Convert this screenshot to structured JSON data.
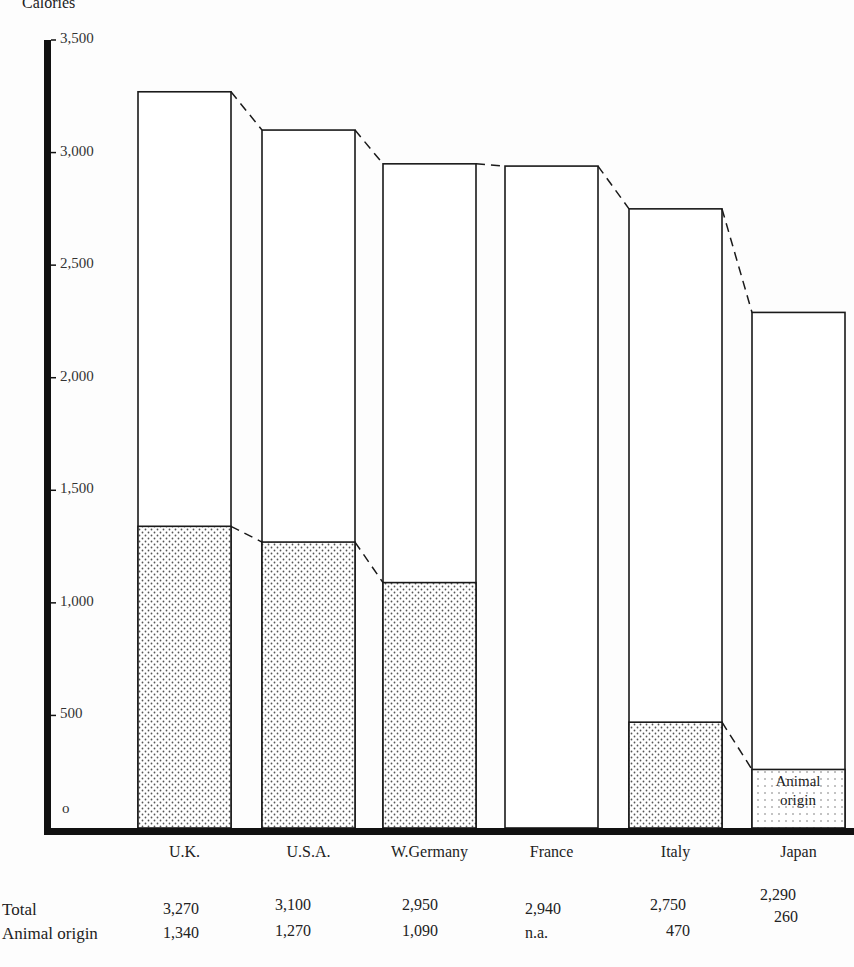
{
  "chart_data": {
    "type": "bar",
    "subtype": "stacked-overlap",
    "title": "",
    "ylabel": "Calories",
    "xlabel": "",
    "ylim": [
      0,
      3500
    ],
    "yticks": [
      0,
      500,
      1000,
      1500,
      2000,
      2500,
      3000,
      3500
    ],
    "ytick_labels": [
      "o",
      "500",
      "1,000",
      "1,500",
      "2,000",
      "2,500",
      "3,000",
      "3,500"
    ],
    "grid": false,
    "categories": [
      "U.K.",
      "U.S.A.",
      "W.Germany",
      "France",
      "Italy",
      "Japan"
    ],
    "series": [
      {
        "name": "Total",
        "values": [
          3270,
          3100,
          2950,
          2940,
          2750,
          2290
        ]
      },
      {
        "name": "Animal origin",
        "values": [
          1340,
          1270,
          1090,
          null,
          470,
          260
        ]
      }
    ],
    "annotations": [
      {
        "text": "Animal origin",
        "position": "inside Japan animal-origin bar"
      },
      {
        "text": "dashed connector lines join adjacent bar tops"
      }
    ],
    "table": {
      "rows": [
        {
          "label": "Total",
          "values": [
            "3,270",
            "3,100",
            "2,950",
            "2,940",
            "2,750",
            "2,290"
          ]
        },
        {
          "label": "Animal origin",
          "values": [
            "1,340",
            "1,270",
            "1,090",
            "n.a.",
            "470",
            "260"
          ]
        }
      ]
    }
  },
  "labels": {
    "ylabel": "Calories",
    "inbar_line1": "Animal",
    "inbar_line2": "origin",
    "row_total": "Total",
    "row_animal": "Animal origin"
  },
  "colors": {
    "line": "#1a1a1a",
    "fill": "#ffffff",
    "dot": "#555555",
    "background": "#fdfdfd"
  }
}
